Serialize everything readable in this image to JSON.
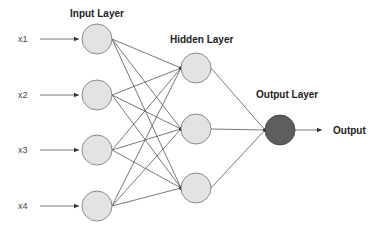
{
  "diagram": {
    "type": "neural-network",
    "layers": {
      "input": {
        "title": "Input Layer",
        "node_count": 4,
        "inputs": [
          "x1",
          "x2",
          "x3",
          "x4"
        ]
      },
      "hidden": {
        "title": "Hidden Layer",
        "node_count": 3
      },
      "output": {
        "title": "Output Layer",
        "node_count": 1,
        "label": "Output"
      }
    },
    "connections": "fully-connected",
    "colors": {
      "node_fill": "#e3e3e3",
      "node_stroke": "#8a8a8a",
      "output_node_fill": "#5e5e5e",
      "edge": "#555555",
      "text": "#222222"
    }
  }
}
